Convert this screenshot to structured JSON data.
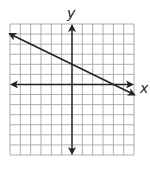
{
  "chart_data": {
    "type": "line",
    "title": "",
    "xlabel": "x",
    "ylabel": "y",
    "grid": true,
    "xlim": [
      -6,
      6
    ],
    "ylim": [
      -7,
      6
    ],
    "series": [
      {
        "name": "line",
        "equation": "y = -0.5x + 2",
        "x": [
          -6,
          6
        ],
        "y": [
          5,
          -1
        ],
        "arrows": "both"
      }
    ],
    "axes_arrows": true
  },
  "labels": {
    "x": "x",
    "y": "y"
  }
}
